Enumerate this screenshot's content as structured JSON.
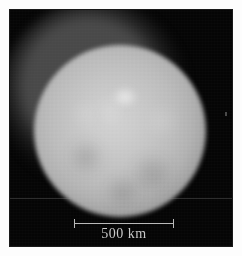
{
  "figure": {
    "frame_background": "#050505",
    "page_background": "#ffffff"
  },
  "image": {
    "body_name": "Ceres",
    "feature_label": "bright spot",
    "disk_color": "#c8c8c8",
    "sky_color": "#050505"
  },
  "scale_bar": {
    "label": "500 km",
    "value": 500,
    "unit": "km",
    "bar_color": "#b9b9b9",
    "text_color": "#c9c9c9"
  }
}
